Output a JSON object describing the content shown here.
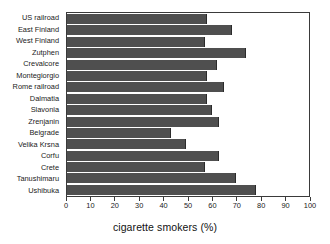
{
  "chart_data": {
    "type": "bar",
    "orientation": "horizontal",
    "title": "",
    "xlabel": "cigarette smokers (%)",
    "ylabel": "",
    "xlim": [
      0,
      100
    ],
    "xticks": [
      0,
      10,
      20,
      30,
      40,
      50,
      60,
      70,
      80,
      90,
      100
    ],
    "xtick_labels": [
      "0",
      "10",
      "20",
      "30",
      "40",
      "50",
      "60",
      "70",
      "80",
      "90",
      "100"
    ],
    "grid": false,
    "legend": null,
    "bar_color": "#4f4f4f",
    "categories": [
      "US railroad",
      "East Finland",
      "West Finland",
      "Zutphen",
      "Crevalcore",
      "Montegiorgio",
      "Rome railroad",
      "Dalmatia",
      "Slavonia",
      "Zrenjanin",
      "Belgrade",
      "Velika Krsna",
      "Corfu",
      "Crete",
      "Tanushimaru",
      "Ushibuka"
    ],
    "values": [
      58,
      68,
      57,
      74,
      62,
      58,
      65,
      58,
      60,
      63,
      43,
      49,
      63,
      57,
      70,
      78
    ]
  }
}
